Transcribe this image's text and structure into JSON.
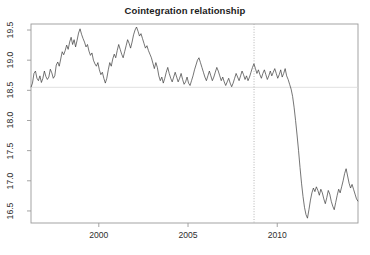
{
  "figure": {
    "width": 370,
    "height": 255,
    "background": "#ffffff"
  },
  "chart_data": {
    "type": "line",
    "title": "Cointegration relationship",
    "xlabel": "",
    "ylabel": "",
    "xlim": [
      1996.2,
      1996.2
    ],
    "xlim_values": [
      1996.2,
      1996.2
    ],
    "x_range": [
      1996.2,
      1996.2
    ],
    "axis": {
      "x_min": 1996.2,
      "x_max": 1996.2,
      "y_min": 16.5,
      "y_max": 19.5
    },
    "xlim_actual": [
      1996.2,
      1996.2
    ],
    "ylim": [
      16.3,
      19.6
    ],
    "x_ticks": [
      2000,
      2005,
      2010
    ],
    "x_tick_labels": [
      "2000",
      "2005",
      "2010"
    ],
    "y_ticks": [
      16.5,
      17.0,
      17.5,
      18.0,
      18.5,
      19.0,
      19.5
    ],
    "y_tick_labels": [
      "16.5",
      "17.0",
      "17.5",
      "18.0",
      "18.5",
      "19.0",
      "19.5"
    ],
    "y_tick_labels_rotated": true,
    "grid": false,
    "legend": null,
    "legend_position": "none",
    "box": true,
    "series": [
      {
        "name": "cointegration residual",
        "color": "#3a3a3a",
        "linewidth": 0.7,
        "x_start": 1996.2,
        "x_step": 0.0833,
        "values": [
          18.55,
          18.62,
          18.78,
          18.82,
          18.7,
          18.66,
          18.74,
          18.63,
          18.7,
          18.82,
          18.73,
          18.68,
          18.72,
          18.85,
          18.79,
          18.7,
          18.74,
          18.92,
          18.97,
          18.9,
          19.02,
          19.14,
          19.09,
          19.16,
          19.25,
          19.18,
          19.3,
          19.38,
          19.26,
          19.34,
          19.22,
          19.33,
          19.45,
          19.52,
          19.43,
          19.36,
          19.3,
          19.22,
          19.26,
          19.15,
          19.08,
          19.12,
          19.0,
          18.94,
          18.9,
          18.96,
          18.84,
          18.76,
          18.8,
          18.7,
          18.62,
          18.7,
          18.84,
          18.96,
          18.9,
          19.02,
          19.1,
          19.04,
          19.16,
          19.26,
          19.18,
          19.1,
          19.04,
          19.14,
          19.24,
          19.34,
          19.28,
          19.2,
          19.3,
          19.42,
          19.5,
          19.55,
          19.48,
          19.4,
          19.44,
          19.36,
          19.28,
          19.2,
          19.24,
          19.16,
          19.1,
          19.04,
          18.95,
          18.86,
          18.96,
          18.88,
          18.74,
          18.66,
          18.72,
          18.62,
          18.7,
          18.8,
          18.88,
          18.78,
          18.7,
          18.64,
          18.72,
          18.8,
          18.72,
          18.64,
          18.7,
          18.78,
          18.68,
          18.6,
          18.64,
          18.72,
          18.62,
          18.58,
          18.66,
          18.74,
          18.84,
          18.92,
          19.0,
          19.04,
          18.96,
          18.88,
          18.8,
          18.72,
          18.66,
          18.74,
          18.82,
          18.74,
          18.66,
          18.72,
          18.8,
          18.88,
          18.82,
          18.74,
          18.66,
          18.72,
          18.64,
          18.58,
          18.64,
          18.7,
          18.62,
          18.56,
          18.62,
          18.7,
          18.78,
          18.72,
          18.66,
          18.74,
          18.82,
          18.76,
          18.68,
          18.74,
          18.66,
          18.72,
          18.8,
          18.88,
          18.94,
          18.86,
          18.78,
          18.84,
          18.76,
          18.7,
          18.78,
          18.84,
          18.76,
          18.68,
          18.74,
          18.82,
          18.74,
          18.8,
          18.86,
          18.78,
          18.7,
          18.76,
          18.84,
          18.72,
          18.78,
          18.86,
          18.74,
          18.68,
          18.6,
          18.52,
          18.4,
          18.22,
          18.0,
          17.76,
          17.5,
          17.22,
          16.96,
          16.74,
          16.56,
          16.44,
          16.38,
          16.52,
          16.68,
          16.8,
          16.88,
          16.82,
          16.9,
          16.84,
          16.76,
          16.86,
          16.8,
          16.7,
          16.62,
          16.72,
          16.84,
          16.78,
          16.66,
          16.58,
          16.52,
          16.64,
          16.76,
          16.86,
          16.8,
          16.9,
          17.0,
          17.12,
          17.2,
          17.08,
          16.96,
          16.88,
          16.94,
          16.86,
          16.78,
          16.7,
          16.66
        ]
      }
    ],
    "reference_lines": [
      {
        "name": "mean-reference-line",
        "orientation": "horizontal",
        "value": 18.55,
        "style": "solid",
        "color": "#d8d8d8"
      },
      {
        "name": "structural-break-line",
        "orientation": "vertical",
        "value": 2008.7,
        "style": "dotted",
        "color": "#b5b5b5"
      }
    ]
  }
}
